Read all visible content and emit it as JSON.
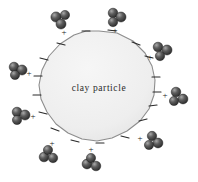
{
  "figure": {
    "name": "clay-particle-diagram",
    "label": "clay  particle",
    "background_color": "#ffffff",
    "particle": {
      "fill_color": "#efefef",
      "stroke_color": "#8d8d8d",
      "center": [
        99,
        88
      ],
      "radius": 57
    },
    "negative_sign": "–",
    "positive_sign": "+",
    "molecule_colors": {
      "dark": "#3b3b3b",
      "mid": "#5e5e5e",
      "light": "#8a8a8a",
      "highlight": "#bdbdbd",
      "outline": "#262626"
    },
    "negative_charges": [
      {
        "x": 86,
        "y": 31,
        "angle": -100
      },
      {
        "x": 112,
        "y": 30,
        "angle": -72
      },
      {
        "x": 136,
        "y": 43,
        "angle": -42
      },
      {
        "x": 149,
        "y": 57,
        "angle": -24
      },
      {
        "x": 155,
        "y": 78,
        "angle": -4
      },
      {
        "x": 155,
        "y": 92,
        "angle": 6
      },
      {
        "x": 152,
        "y": 106,
        "angle": 20
      },
      {
        "x": 143,
        "y": 121,
        "angle": 38
      },
      {
        "x": 124,
        "y": 136,
        "angle": 60
      },
      {
        "x": 100,
        "y": 143,
        "angle": 86
      },
      {
        "x": 75,
        "y": 140,
        "angle": 104
      },
      {
        "x": 55,
        "y": 128,
        "angle": 126
      },
      {
        "x": 43,
        "y": 112,
        "angle": 148
      },
      {
        "x": 38,
        "y": 94,
        "angle": 170
      },
      {
        "x": 39,
        "y": 76,
        "angle": 190
      },
      {
        "x": 45,
        "y": 58,
        "angle": 210
      },
      {
        "x": 61,
        "y": 43,
        "angle": 234
      }
    ],
    "cations": [
      {
        "id": "cation-top-left",
        "mx": 60,
        "my": 19,
        "px": 63,
        "py": 33
      },
      {
        "id": "cation-top-right",
        "mx": 116,
        "my": 18,
        "px": 114,
        "py": 31
      },
      {
        "id": "cation-right-upper",
        "mx": 160,
        "my": 52,
        "px": 150,
        "py": 57
      },
      {
        "id": "cation-right-lower",
        "mx": 174,
        "my": 97,
        "px": 164,
        "py": 96
      },
      {
        "id": "cation-bottom-right",
        "mx": 153,
        "my": 140,
        "px": 143,
        "py": 138
      },
      {
        "id": "cation-bottom-center",
        "mx": 91,
        "my": 164,
        "px": 91,
        "py": 150
      },
      {
        "id": "cation-bottom-left",
        "mx": 47,
        "my": 155,
        "px": 50,
        "py": 143
      },
      {
        "id": "cation-left-lower",
        "mx": 21,
        "my": 116,
        "px": 31,
        "py": 117
      },
      {
        "id": "cation-left-upper",
        "mx": 17,
        "my": 71,
        "px": 27,
        "py": 74
      },
      {
        "id": "cation-upper-left-outer",
        "mx": 58,
        "my": 22,
        "px": 62,
        "py": 34
      }
    ]
  }
}
